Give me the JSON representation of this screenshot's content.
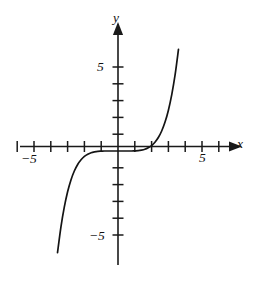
{
  "figure": {
    "background_color": "#ffffff",
    "stroke_color": "#141414",
    "width": 259,
    "height": 281
  },
  "axes": {
    "x_axis_label": "x",
    "y_axis_label": "y",
    "origin_px": {
      "x": 118,
      "y": 151
    },
    "unit_px": {
      "x": 16.8,
      "y": 16.8
    },
    "x_tick_labels": [
      {
        "text": "−5",
        "value": -5
      },
      {
        "text": "5",
        "value": 5
      }
    ],
    "y_tick_labels": [
      {
        "text": "5",
        "value": 5
      },
      {
        "text": "−5",
        "value": -5
      }
    ],
    "x_tick_values": [
      -6,
      -5,
      -4,
      -3,
      -2,
      -1,
      1,
      2,
      3,
      4,
      5,
      6
    ],
    "y_tick_values": [
      -5,
      -4,
      -3,
      -2,
      -1,
      1,
      2,
      3,
      4,
      5
    ],
    "x_range": [
      -6.9,
      7.1
    ],
    "y_range": [
      -7.2,
      6.6
    ],
    "arrowheads": [
      "x-positive",
      "y-positive"
    ]
  },
  "chart_data": {
    "type": "line",
    "title": "",
    "subtitle": "",
    "xlabel": "x",
    "ylabel": "y",
    "xlim": [
      -6.9,
      7.1
    ],
    "ylim": [
      -7.2,
      6.6
    ],
    "grid": false,
    "legend": null,
    "annotations": [],
    "series": [
      {
        "name": "odd power curve",
        "equation": "y = x^5 / 10",
        "x": [
          -3.6,
          -3.4,
          -3.2,
          -3.0,
          -2.8,
          -2.6,
          -2.4,
          -2.2,
          -2.0,
          -1.8,
          -1.6,
          -1.4,
          -1.2,
          -1.0,
          -0.8,
          -0.6,
          -0.4,
          -0.2,
          0.0,
          0.2,
          0.4,
          0.6,
          0.8,
          1.0,
          1.2,
          1.4,
          1.6,
          1.8,
          2.0,
          2.2,
          2.4,
          2.6,
          2.8,
          3.0,
          3.2,
          3.4,
          3.6
        ],
        "y": [
          -6.05,
          -4.54,
          -3.36,
          -2.43,
          -1.72,
          -1.19,
          -0.8,
          -0.52,
          -0.32,
          -0.19,
          -0.1,
          -0.05,
          -0.02,
          -0.01,
          0.0,
          0.0,
          0.0,
          0.0,
          0.0,
          0.0,
          0.0,
          0.0,
          0.0,
          0.01,
          0.02,
          0.05,
          0.1,
          0.19,
          0.32,
          0.52,
          0.8,
          1.19,
          1.72,
          2.43,
          3.36,
          4.54,
          6.05
        ]
      }
    ]
  }
}
